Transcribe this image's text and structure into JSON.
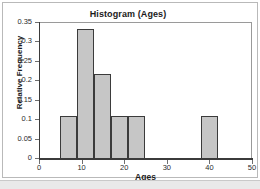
{
  "chart_data": {
    "type": "bar",
    "title": "Histogram (Ages)",
    "xlabel": "Ages",
    "ylabel": "Relative Frequency",
    "xlim": [
      0,
      50
    ],
    "ylim": [
      0,
      0.35
    ],
    "grid": false,
    "legend": null,
    "x_ticks": [
      {
        "value": 0,
        "label": "0"
      },
      {
        "value": 10,
        "label": "10"
      },
      {
        "value": 20,
        "label": "20"
      },
      {
        "value": 30,
        "label": "30"
      },
      {
        "value": 40,
        "label": "40"
      },
      {
        "value": 50,
        "label": "50"
      }
    ],
    "y_ticks": [
      {
        "value": 0.35,
        "label": "0.35"
      },
      {
        "value": 0.3,
        "label": "0.3"
      },
      {
        "value": 0.25,
        "label": "0.25"
      },
      {
        "value": 0.2,
        "label": "0.2"
      },
      {
        "value": 0.15,
        "label": "0.15"
      },
      {
        "value": 0.1,
        "label": "0.1"
      },
      {
        "value": 0.05,
        "label": "0.05"
      },
      {
        "value": 0,
        "label": "0"
      }
    ],
    "bin_width": 4,
    "bins": [
      {
        "start": 5,
        "end": 9,
        "value": 0.11
      },
      {
        "start": 9,
        "end": 13,
        "value": 0.335
      },
      {
        "start": 13,
        "end": 17,
        "value": 0.22
      },
      {
        "start": 17,
        "end": 21,
        "value": 0.11
      },
      {
        "start": 21,
        "end": 25,
        "value": 0.11
      },
      {
        "start": 38,
        "end": 42,
        "value": 0.11
      }
    ],
    "categories": [
      "5-9",
      "9-13",
      "13-17",
      "17-21",
      "21-25",
      "38-42"
    ],
    "values": [
      0.11,
      0.335,
      0.22,
      0.11,
      0.11,
      0.11
    ],
    "bar_fill_color": "#c6c6c6",
    "bar_edge_color": "#3b3b3b"
  }
}
